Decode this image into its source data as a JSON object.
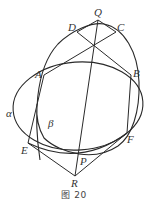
{
  "figure": {
    "caption": "图 20",
    "stroke_color": "#2a2a2a",
    "label_color": "#333333"
  },
  "points": {
    "Q": {
      "label": "Q",
      "x": 98,
      "y": 20
    },
    "D": {
      "label": "D",
      "x": 77,
      "y": 32
    },
    "C": {
      "label": "C",
      "x": 116,
      "y": 32
    },
    "A": {
      "label": "A",
      "x": 44,
      "y": 75
    },
    "B": {
      "label": "B",
      "x": 131,
      "y": 75
    },
    "E": {
      "label": "E",
      "x": 28,
      "y": 143
    },
    "F": {
      "label": "F",
      "x": 127,
      "y": 133
    },
    "P": {
      "label": "P",
      "x": 79,
      "y": 153
    },
    "R": {
      "label": "R",
      "x": 75,
      "y": 176
    }
  },
  "curves": {
    "alpha": {
      "label": "α"
    },
    "beta": {
      "label": "β"
    }
  },
  "segments": [
    [
      "Q",
      "D"
    ],
    [
      "Q",
      "C"
    ],
    [
      "A",
      "C"
    ],
    [
      "D",
      "B"
    ],
    [
      "Q",
      "R"
    ],
    [
      "A",
      "E"
    ],
    [
      "B",
      "F"
    ],
    [
      "E",
      "R"
    ],
    [
      "F",
      "R"
    ]
  ]
}
